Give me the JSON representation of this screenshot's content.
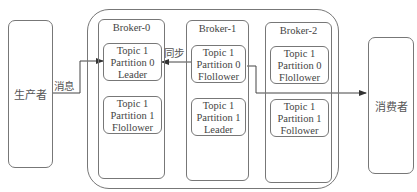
{
  "producer": {
    "label": "生产者"
  },
  "consumer": {
    "label": "消费者"
  },
  "edges": {
    "message_label": "消息",
    "sync_label": "同步"
  },
  "brokers": [
    {
      "title": "Broker-0",
      "partitions": [
        {
          "topic": "Topic 1",
          "partition": "Partition 0",
          "role": "Leader"
        },
        {
          "topic": "Topic 1",
          "partition": "Partition 1",
          "role": "Flollower"
        }
      ]
    },
    {
      "title": "Broker-1",
      "partitions": [
        {
          "topic": "Topic 1",
          "partition": "Partition 0",
          "role": "Flollower"
        },
        {
          "topic": "Topic 1",
          "partition": "Partition 1",
          "role": "Leader"
        }
      ]
    },
    {
      "title": "Broker-2",
      "partitions": [
        {
          "topic": "Topic 1",
          "partition": "Partition 0",
          "role": "Flollower"
        },
        {
          "topic": "Topic 1",
          "partition": "Partition 1",
          "role": "Follower"
        }
      ]
    }
  ]
}
